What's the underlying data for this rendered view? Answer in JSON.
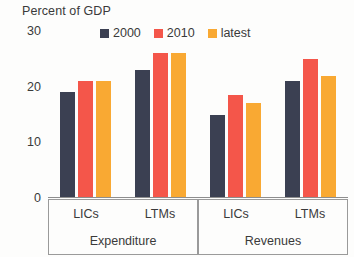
{
  "chart_data": {
    "type": "bar",
    "title": "Percent of GDP",
    "subtitle": "",
    "xlabel": "",
    "ylabel": "",
    "ylim": [
      0,
      30
    ],
    "yticks": [
      0,
      10,
      20,
      30
    ],
    "ytick_labels": [
      "0",
      "10",
      "20",
      "30"
    ],
    "grid": false,
    "legend_position": "top-center",
    "categories": [
      "LICs",
      "LTMs",
      "LICs",
      "LTMs"
    ],
    "group_sections": [
      {
        "name": "Expenditure",
        "categories": [
          "LICs",
          "LTMs"
        ]
      },
      {
        "name": "Revenues",
        "categories": [
          "LICs",
          "LTMs"
        ]
      }
    ],
    "series": [
      {
        "name": "2000",
        "color": "#3b4052",
        "values": [
          19,
          23,
          15,
          21
        ]
      },
      {
        "name": "2010",
        "color": "#f4564a",
        "values": [
          21,
          26,
          18.5,
          25
        ]
      },
      {
        "name": "latest",
        "color": "#f9a933",
        "values": [
          21,
          26,
          17,
          22
        ]
      }
    ]
  },
  "title": {
    "text": "Percent of GDP"
  },
  "legend": {
    "items": [
      {
        "label": "2000",
        "color": "#3b4052"
      },
      {
        "label": "2010",
        "color": "#f4564a"
      },
      {
        "label": "latest",
        "color": "#f9a933"
      }
    ]
  },
  "axis": {
    "y_labels": [
      "30",
      "20",
      "10",
      "0"
    ]
  }
}
